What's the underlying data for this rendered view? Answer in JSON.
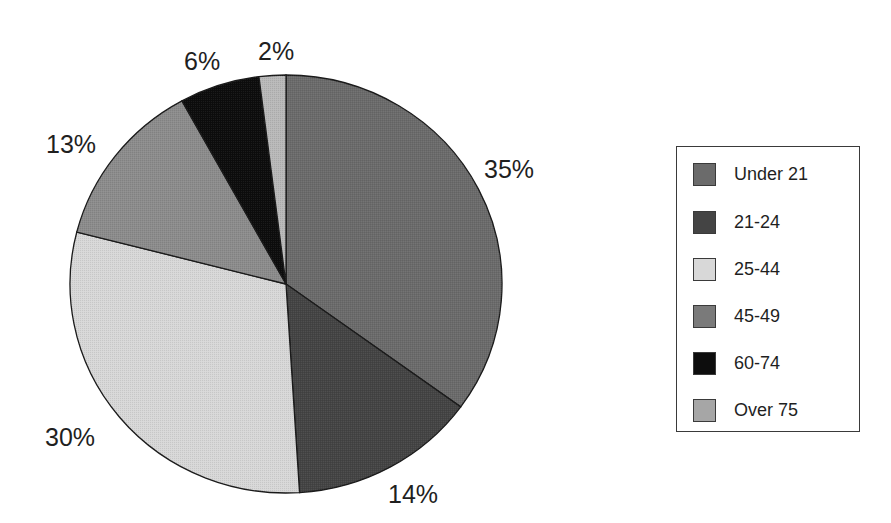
{
  "chart_data": {
    "type": "pie",
    "title": "",
    "start_angle": "12 o'clock",
    "direction": "clockwise",
    "categories": [
      "Under 21",
      "21-24",
      "25-44",
      "45-49",
      "60-74",
      "Over 75"
    ],
    "values": [
      35,
      14,
      30,
      13,
      6,
      2
    ],
    "labels": [
      "35%",
      "14%",
      "30%",
      "13%",
      "6%",
      "2%"
    ],
    "colors": [
      "#6b6b6b",
      "#444444",
      "#d8d8d8",
      "#8c8c8c",
      "#0d0d0d",
      "#b9b9b9"
    ],
    "legend_position": "right"
  },
  "legend": {
    "items": [
      {
        "label": "Under 21",
        "color": "#6b6b6b"
      },
      {
        "label": "21-24",
        "color": "#444444"
      },
      {
        "label": "25-44",
        "color": "#d8d8d8"
      },
      {
        "label": "45-49",
        "color": "#7a7a7a"
      },
      {
        "label": "60-74",
        "color": "#0d0d0d"
      },
      {
        "label": "Over 75",
        "color": "#a6a6a6"
      }
    ]
  },
  "slice_labels": [
    {
      "text": "35%",
      "x": 484,
      "y": 178
    },
    {
      "text": "14%",
      "x": 388,
      "y": 503
    },
    {
      "text": "30%",
      "x": 45,
      "y": 446
    },
    {
      "text": "13%",
      "x": 46,
      "y": 153
    },
    {
      "text": "6%",
      "x": 184,
      "y": 70
    },
    {
      "text": "2%",
      "x": 258,
      "y": 60
    }
  ]
}
